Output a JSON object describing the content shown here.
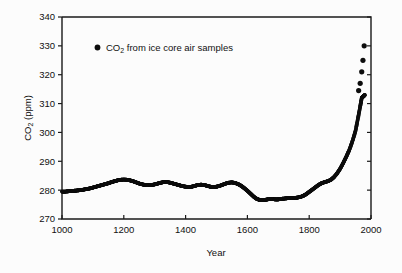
{
  "chart_data": {
    "type": "scatter",
    "title": "",
    "xlabel": "Year",
    "ylabel": "CO2 (ppm)",
    "ylabel_parts": {
      "pre": "CO",
      "sub": "2",
      "post": " (ppm)"
    },
    "xlim": [
      1000,
      2000
    ],
    "ylim": [
      270,
      340
    ],
    "xticks": [
      1000,
      1200,
      1400,
      1600,
      1800,
      2000
    ],
    "xticklabels": [
      "1000",
      "1200",
      "1400",
      "1600",
      "1800",
      "2000"
    ],
    "yticks": [
      270,
      280,
      290,
      300,
      310,
      320,
      330,
      340
    ],
    "yticklabels": [
      "270",
      "280",
      "290",
      "300",
      "310",
      "320",
      "330",
      "340"
    ],
    "grid": false,
    "legend": {
      "position": "upper-left-inside",
      "marker": "filled-circle",
      "marker_color": "#0d0d0d",
      "entries": [
        {
          "label": "CO2 from ice core air samples",
          "label_parts": {
            "pre": "CO",
            "sub": "2",
            "post": " from ice core air samples"
          }
        }
      ]
    },
    "series": [
      {
        "name": "CO2 from ice core air samples",
        "marker": "filled-circle",
        "color": "#0d0d0d",
        "x": [
          1000,
          1010,
          1020,
          1030,
          1040,
          1050,
          1060,
          1070,
          1080,
          1090,
          1100,
          1110,
          1120,
          1130,
          1140,
          1150,
          1160,
          1170,
          1180,
          1190,
          1200,
          1210,
          1220,
          1230,
          1240,
          1250,
          1260,
          1270,
          1280,
          1290,
          1300,
          1310,
          1320,
          1330,
          1340,
          1350,
          1360,
          1370,
          1380,
          1390,
          1400,
          1410,
          1420,
          1430,
          1440,
          1450,
          1460,
          1470,
          1480,
          1490,
          1500,
          1510,
          1520,
          1530,
          1540,
          1550,
          1560,
          1570,
          1580,
          1590,
          1600,
          1610,
          1620,
          1630,
          1640,
          1650,
          1660,
          1670,
          1680,
          1690,
          1700,
          1710,
          1720,
          1730,
          1740,
          1750,
          1760,
          1770,
          1780,
          1790,
          1800,
          1810,
          1820,
          1830,
          1840,
          1850,
          1860,
          1870,
          1880,
          1890,
          1900,
          1910,
          1920,
          1930,
          1940,
          1950,
          1958,
          1965,
          1970,
          1975,
          1980
        ],
        "y": [
          279.5,
          279.5,
          279.6,
          279.7,
          279.8,
          279.9,
          280.0,
          280.2,
          280.4,
          280.6,
          280.9,
          281.2,
          281.5,
          281.8,
          282.1,
          282.4,
          282.8,
          283.1,
          283.4,
          283.6,
          283.7,
          283.6,
          283.4,
          283.1,
          282.7,
          282.3,
          282.0,
          281.8,
          281.7,
          281.8,
          282.0,
          282.3,
          282.6,
          282.8,
          282.8,
          282.6,
          282.3,
          282.0,
          281.7,
          281.4,
          281.2,
          281.1,
          281.2,
          281.5,
          281.8,
          281.9,
          281.8,
          281.5,
          281.2,
          281.1,
          281.2,
          281.5,
          281.9,
          282.3,
          282.6,
          282.7,
          282.5,
          282.1,
          281.5,
          280.7,
          279.8,
          278.8,
          277.8,
          277.0,
          276.6,
          276.5,
          276.7,
          276.9,
          276.9,
          276.8,
          276.8,
          277.0,
          277.1,
          277.2,
          277.2,
          277.3,
          277.4,
          277.6,
          278.0,
          278.6,
          279.4,
          280.2,
          281.0,
          281.8,
          282.4,
          282.8,
          283.1,
          283.6,
          284.5,
          285.8,
          287.4,
          289.4,
          291.6,
          294.0,
          297.0,
          300.6,
          305.0,
          309.0,
          312.0,
          312.5,
          313.0
        ],
        "separated_upper_points": {
          "x": [
            1960,
            1965,
            1970,
            1974,
            1978
          ],
          "y": [
            314.5,
            317.0,
            321.0,
            325.0,
            330.0
          ]
        }
      }
    ]
  }
}
